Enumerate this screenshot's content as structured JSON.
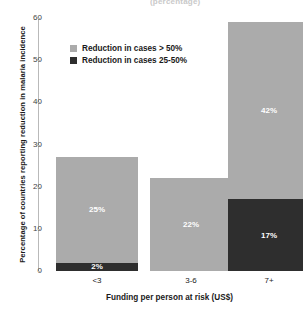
{
  "chart_data": {
    "type": "bar",
    "title": "",
    "cut_off_title": "(percentage)",
    "xlabel": "Funding per person at risk (US$)",
    "ylabel": "Percentage of countries reporting reduction in malaria incidence",
    "categories": [
      "<3",
      "3-6",
      "7+"
    ],
    "ylim": [
      0,
      60
    ],
    "yticks": [
      0,
      10,
      20,
      30,
      40,
      50,
      60
    ],
    "ytick_labels": [
      "0",
      "10",
      "20",
      "30",
      "40",
      "50",
      "60"
    ],
    "grid": false,
    "stacked": true,
    "legend_position": "upper-left-inside",
    "series": [
      {
        "name": "Reduction in cases > 50%",
        "color": "#ababab",
        "values": [
          25,
          22,
          42
        ],
        "labels": [
          "25%",
          "22%",
          "42%"
        ]
      },
      {
        "name": "Reduction in cases 25-50%",
        "color": "#2e2e2e",
        "values": [
          2,
          0,
          17
        ],
        "labels": [
          "2%",
          "",
          "17%"
        ]
      }
    ],
    "totals": [
      27,
      22,
      59
    ]
  },
  "colors": {
    "light_gray": "#ababab",
    "dark_gray": "#2e2e2e",
    "axis": "#b9b9b9",
    "text": "#1a1a1a",
    "background": "#ffffff"
  }
}
